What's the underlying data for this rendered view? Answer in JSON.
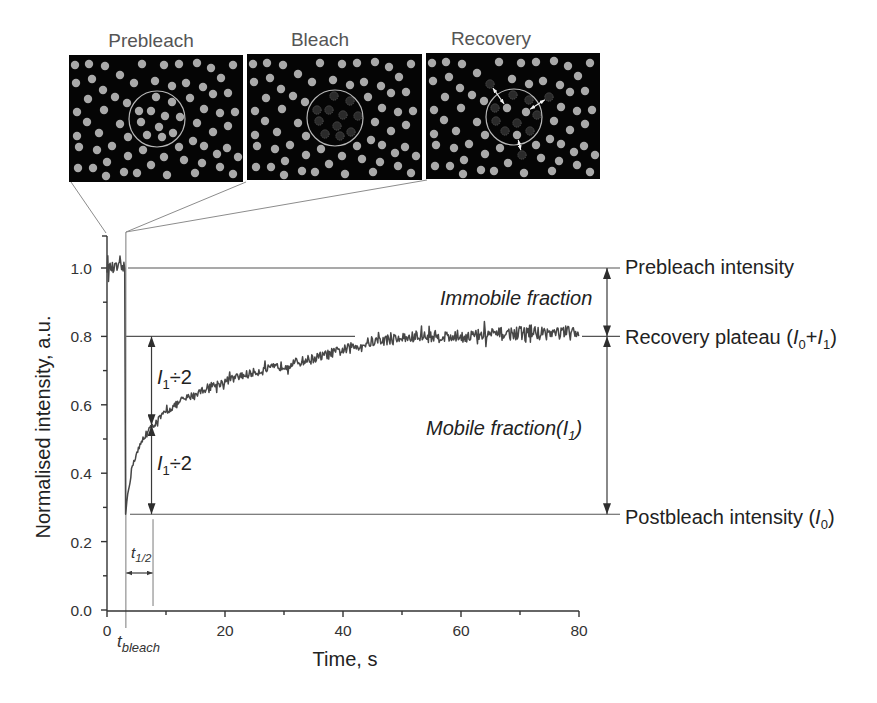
{
  "figure": {
    "panels": [
      {
        "title": "Prebleach"
      },
      {
        "title": "Bleach"
      },
      {
        "title": "Recovery"
      }
    ],
    "particles": {
      "base": [
        [
          6,
          10
        ],
        [
          20,
          9
        ],
        [
          36,
          11
        ],
        [
          73,
          9
        ],
        [
          95,
          10
        ],
        [
          110,
          9
        ],
        [
          128,
          8
        ],
        [
          142,
          13
        ],
        [
          164,
          10
        ],
        [
          7,
          28
        ],
        [
          23,
          24
        ],
        [
          51,
          20
        ],
        [
          86,
          26
        ],
        [
          103,
          31
        ],
        [
          117,
          28
        ],
        [
          134,
          32
        ],
        [
          152,
          23
        ],
        [
          34,
          35
        ],
        [
          19,
          44
        ],
        [
          46,
          42
        ],
        [
          58,
          48
        ],
        [
          144,
          39
        ],
        [
          159,
          38
        ],
        [
          8,
          57
        ],
        [
          35,
          55
        ],
        [
          135,
          54
        ],
        [
          151,
          58
        ],
        [
          166,
          57
        ],
        [
          18,
          67
        ],
        [
          51,
          69
        ],
        [
          128,
          68
        ],
        [
          159,
          71
        ],
        [
          8,
          81
        ],
        [
          30,
          78
        ],
        [
          59,
          82
        ],
        [
          124,
          86
        ],
        [
          144,
          77
        ],
        [
          10,
          92
        ],
        [
          28,
          95
        ],
        [
          43,
          91
        ],
        [
          74,
          95
        ],
        [
          110,
          92
        ],
        [
          135,
          91
        ],
        [
          158,
          93
        ],
        [
          59,
          101
        ],
        [
          38,
          107
        ],
        [
          82,
          110
        ],
        [
          115,
          105
        ],
        [
          133,
          108
        ],
        [
          148,
          99
        ],
        [
          169,
          102
        ],
        [
          9,
          113
        ],
        [
          24,
          113
        ],
        [
          55,
          117
        ],
        [
          68,
          118
        ],
        [
          37,
          121
        ],
        [
          98,
          120
        ],
        [
          126,
          118
        ],
        [
          151,
          112
        ],
        [
          164,
          119
        ]
      ],
      "movers": [
        [
          65,
          28
        ],
        [
          121,
          43
        ],
        [
          95,
          102
        ]
      ],
      "inner": [
        [
          87,
          42
        ],
        [
          103,
          47
        ],
        [
          70,
          56
        ],
        [
          82,
          56
        ],
        [
          96,
          61
        ],
        [
          111,
          62
        ],
        [
          72,
          67
        ],
        [
          90,
          72
        ],
        [
          78,
          80
        ],
        [
          93,
          82
        ],
        [
          104,
          78
        ]
      ],
      "recovery_inner_bright": [
        [
          81,
          55
        ],
        [
          100,
          59
        ],
        [
          91,
          82
        ]
      ],
      "recovery_inner_dark": [
        [
          87,
          42
        ],
        [
          103,
          47
        ],
        [
          69,
          55
        ],
        [
          70,
          68
        ],
        [
          111,
          62
        ],
        [
          91,
          70
        ],
        [
          79,
          78
        ],
        [
          104,
          78
        ]
      ],
      "recovery_outer_dark": [
        [
          64,
          31
        ],
        [
          123,
          44
        ],
        [
          96,
          102
        ]
      ],
      "recovery_arrows": [
        [
          [
            64,
            31
          ],
          [
            81,
            55
          ]
        ],
        [
          [
            123,
            44
          ],
          [
            100,
            59
          ]
        ],
        [
          [
            91,
            82
          ],
          [
            96,
            102
          ]
        ]
      ],
      "roi_circle": {
        "cx": 88,
        "cy": 64,
        "r": 28
      }
    },
    "labels": {
      "prebleach_intensity": "Prebleach intensity",
      "recovery_plateau": {
        "prefix": "Recovery plateau (",
        "i0": "I",
        "i0_sub": "0",
        "plus": "+",
        "i1": "I",
        "i1_sub": "1",
        "suffix": ")"
      },
      "postbleach_intensity": {
        "prefix": "Postbleach intensity (",
        "i0": "I",
        "i0_sub": "0",
        "suffix": ")"
      },
      "immobile_fraction": "Immobile fraction",
      "mobile_fraction": {
        "prefix": "Mobile fraction(",
        "i1": "I",
        "i1_sub": "1",
        "suffix": ")"
      },
      "half_upper": {
        "i": "I",
        "sub": "1",
        "rest": "÷2"
      },
      "half_lower": {
        "i": "I",
        "sub": "1",
        "rest": "÷2"
      },
      "t_half": {
        "t": "t",
        "sub": "1/2"
      },
      "t_bleach": {
        "t": "t",
        "sub": "bleach"
      }
    }
  },
  "chart_data": {
    "type": "line",
    "title": "",
    "xlabel": "Time, s",
    "ylabel": "Normalised intensity, a.u.",
    "xlim": [
      0,
      80
    ],
    "ylim": [
      0,
      1.0
    ],
    "grid": false,
    "legend": null,
    "x_ticks": [
      0,
      20,
      40,
      60,
      80
    ],
    "x_tick_labels": [
      "0",
      "20",
      "40",
      "60",
      "80"
    ],
    "x_minor_ticks": [
      10,
      30,
      50,
      70
    ],
    "y_ticks": [
      0,
      0.2,
      0.4,
      0.6,
      0.8,
      1.0
    ],
    "y_tick_labels": [
      "0.0",
      "0.2",
      "0.4",
      "0.6",
      "0.8",
      "1.0"
    ],
    "y_minor_ticks": [
      0.1,
      0.3,
      0.5,
      0.7,
      0.9
    ],
    "series": [
      {
        "name": "FRAP fluorescence intensity",
        "x": [
          0,
          3.0,
          3.15,
          3.5,
          4.4,
          6.1,
          7.8,
          10,
          13,
          17,
          21,
          25,
          30,
          35,
          38,
          42,
          45,
          50,
          55,
          60,
          65,
          70,
          80
        ],
        "y": [
          1.0,
          1.0,
          0.28,
          0.34,
          0.43,
          0.5,
          0.54,
          0.58,
          0.615,
          0.65,
          0.675,
          0.695,
          0.715,
          0.735,
          0.75,
          0.77,
          0.785,
          0.795,
          0.8,
          0.8,
          0.805,
          0.81,
          0.81
        ]
      }
    ],
    "noise_amplitude": 0.012,
    "levels": {
      "prebleach": 1.0,
      "recovery_plateau": 0.8,
      "postbleach": 0.28,
      "half_recovery": 0.54
    },
    "t_bleach": 3.2,
    "t_half": 7.8,
    "annotations": [
      "Prebleach intensity",
      "Recovery plateau (I0+I1)",
      "Postbleach intensity (I0)",
      "Immobile fraction",
      "Mobile fraction(I1)",
      "I1÷2",
      "I1÷2",
      "t1/2",
      "tbleach"
    ]
  }
}
